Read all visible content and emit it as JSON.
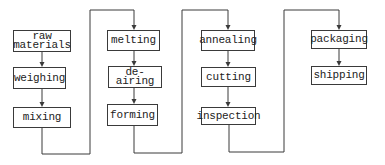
{
  "diagram": {
    "type": "process-flowchart",
    "colors": {
      "line": "#3a3a3a",
      "text": "#222222",
      "background": "#ffffff"
    },
    "columns": [
      {
        "id": "col1",
        "nodes": [
          {
            "id": "raw-materials",
            "label": "raw\nmaterials",
            "x": 13,
            "y": 30,
            "w": 58,
            "h": 22
          },
          {
            "id": "weighing",
            "label": "weighing",
            "x": 13,
            "y": 67,
            "w": 53,
            "h": 22
          },
          {
            "id": "mixing",
            "label": "mixing",
            "x": 13,
            "y": 107,
            "w": 58,
            "h": 21
          }
        ]
      },
      {
        "id": "col2",
        "nodes": [
          {
            "id": "melting",
            "label": "melting",
            "x": 107,
            "y": 30,
            "w": 53,
            "h": 21
          },
          {
            "id": "de-airing",
            "label": "de-airing",
            "x": 108,
            "y": 66,
            "w": 54,
            "h": 22
          },
          {
            "id": "forming",
            "label": "forming",
            "x": 107,
            "y": 104,
            "w": 51,
            "h": 22
          }
        ]
      },
      {
        "id": "col3",
        "nodes": [
          {
            "id": "annealing",
            "label": "annealing",
            "x": 201,
            "y": 30,
            "w": 54,
            "h": 21
          },
          {
            "id": "cutting",
            "label": "cutting",
            "x": 201,
            "y": 67,
            "w": 55,
            "h": 20
          },
          {
            "id": "inspection",
            "label": "inspection",
            "x": 201,
            "y": 107,
            "w": 55,
            "h": 18
          }
        ]
      },
      {
        "id": "col4",
        "nodes": [
          {
            "id": "packaging",
            "label": "packaging",
            "x": 311,
            "y": 30,
            "w": 56,
            "h": 19
          },
          {
            "id": "shipping",
            "label": "shipping",
            "x": 311,
            "y": 66,
            "w": 56,
            "h": 19
          }
        ]
      }
    ],
    "edges": [
      {
        "from": "raw-materials",
        "to": "weighing",
        "points": [
          [
            42,
            52
          ],
          [
            42,
            67
          ]
        ]
      },
      {
        "from": "weighing",
        "to": "mixing",
        "points": [
          [
            42,
            89
          ],
          [
            42,
            107
          ]
        ]
      },
      {
        "from": "mixing",
        "to": "melting",
        "points": [
          [
            42,
            128
          ],
          [
            42,
            154
          ],
          [
            90,
            154
          ],
          [
            90,
            10
          ],
          [
            134,
            10
          ],
          [
            134,
            30
          ]
        ]
      },
      {
        "from": "melting",
        "to": "de-airing",
        "points": [
          [
            134,
            51
          ],
          [
            134,
            66
          ]
        ]
      },
      {
        "from": "de-airing",
        "to": "forming",
        "points": [
          [
            134,
            88
          ],
          [
            134,
            104
          ]
        ]
      },
      {
        "from": "forming",
        "to": "annealing",
        "points": [
          [
            134,
            126
          ],
          [
            134,
            153
          ],
          [
            182,
            153
          ],
          [
            182,
            10
          ],
          [
            228,
            10
          ],
          [
            228,
            30
          ]
        ]
      },
      {
        "from": "annealing",
        "to": "cutting",
        "points": [
          [
            228,
            51
          ],
          [
            228,
            67
          ]
        ]
      },
      {
        "from": "cutting",
        "to": "inspection",
        "points": [
          [
            228,
            87
          ],
          [
            228,
            107
          ]
        ]
      },
      {
        "from": "inspection",
        "to": "packaging",
        "points": [
          [
            229,
            125
          ],
          [
            229,
            152
          ],
          [
            284,
            152
          ],
          [
            284,
            10
          ],
          [
            339,
            10
          ],
          [
            339,
            30
          ]
        ]
      },
      {
        "from": "packaging",
        "to": "shipping",
        "points": [
          [
            339,
            49
          ],
          [
            339,
            66
          ]
        ]
      }
    ]
  }
}
